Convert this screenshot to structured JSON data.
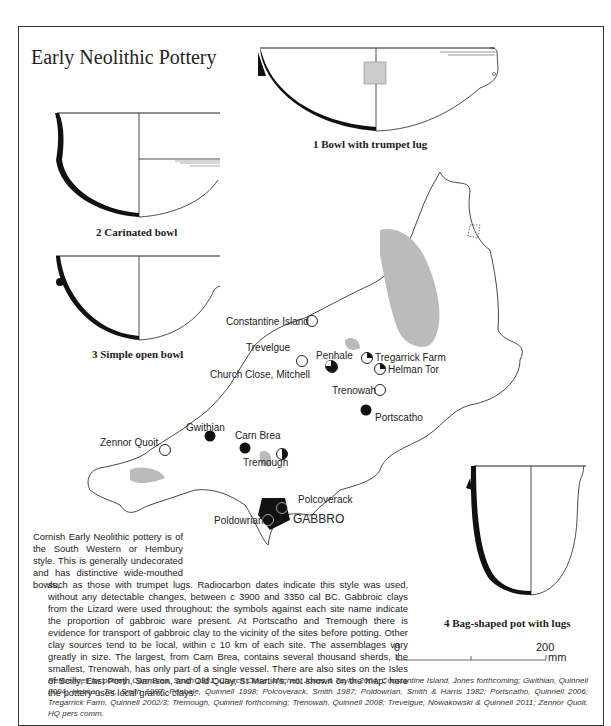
{
  "title": "Early Neolithic Pottery",
  "vessels": [
    {
      "number": "1",
      "caption": "1  Bowl with trumpet lug"
    },
    {
      "number": "2",
      "caption": "2  Carinated bowl"
    },
    {
      "number": "3",
      "caption": "3  Simple open bowl"
    },
    {
      "number": "4",
      "caption": "4  Bag-shaped pot with lugs"
    }
  ],
  "map": {
    "region_label": "GABBRO",
    "sites": [
      {
        "name": "Constantine Island",
        "symbol": "open"
      },
      {
        "name": "Trevelgue",
        "symbol": "open"
      },
      {
        "name": "Penhale",
        "symbol": "three-quarter"
      },
      {
        "name": "Tregarrick Farm",
        "symbol": "quarter"
      },
      {
        "name": "Helman Tor",
        "symbol": "quarter"
      },
      {
        "name": "Church Close, Mitchell",
        "symbol": "half"
      },
      {
        "name": "Trenowah",
        "symbol": "open"
      },
      {
        "name": "Portscatho",
        "symbol": "filled"
      },
      {
        "name": "Gwithian",
        "symbol": "filled"
      },
      {
        "name": "Carn Brea",
        "symbol": "filled"
      },
      {
        "name": "Zennor Quoit",
        "symbol": "open"
      },
      {
        "name": "Tremough",
        "symbol": "half"
      },
      {
        "name": "Polcoverack",
        "symbol": "filled"
      },
      {
        "name": "Poldowrian",
        "symbol": "filled"
      }
    ]
  },
  "description": {
    "intro": "Cornish Early Neolithic pottery is of the South Western or Hembury style. This is generally undecorated and has distinctive wide-mouthed bowls,",
    "body": "such as those with trumpet lugs. Radiocarbon dates indicate this style was used, without any detectable changes, between c 3900 and 3350 cal BC. Gabbroic clays from the Lizard were used throughout: the symbols against each site name indicate the proportion of gabbroic ware present. At Portscatho and Tremough there is evidence for transport of gabbroic clay to the vicinity of the sites before potting. Other clay sources tend to be local, within c 10 km of each site. The assemblages vary greatly in size. The largest, from Carn Brea, contains several thousand sherds, the smallest, Trenowah, has only part of a single vessel. There are also sites on the Isles of Scilly, East Porth, Samson, and Old Quay, St Martin's, not shown on the map: here the pottery uses local granitic clays."
  },
  "scale_bar": {
    "start": "0",
    "end": "200",
    "unit": "mm"
  },
  "references": "References for pottery: Carn Brea, Smith 1981; Church Close, Mitchell, Jones & Taylor 2004; Constantine Island, Jones forthcoming; Gwithian, Quinnell 2004; Helman Tor, Smith 1997; Penhale, Quinnell 1998; Polcoverack, Smith 1987; Poldowrian, Smith & Harris 1982; Portscatho, Quinnell 2006; Tregarrick Farm, Quinnell 2002/3; Tremough, Quinnell forthcoming; Trenowah, Quinnell 2008; Trevelgue, Nowakowski & Quinnell 2011; Zennor Quoit, HQ pers comm."
}
